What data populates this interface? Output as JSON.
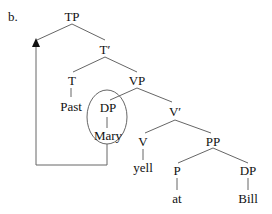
{
  "example_label": "b.",
  "tree": {
    "nodes": {
      "TP": "TP",
      "Tbar": "T′",
      "T": "T",
      "Past": "Past",
      "VP": "VP",
      "DP1": "DP",
      "Mary": "Mary",
      "Vbar": "V′",
      "V": "V",
      "yell": "yell",
      "PP": "PP",
      "P": "P",
      "at": "at",
      "DP2": "DP",
      "Bill": "Bill"
    },
    "annotations": {
      "circled_node": "DP (Mary)",
      "movement_arrow": "from DP Mary to Spec-TP"
    }
  }
}
